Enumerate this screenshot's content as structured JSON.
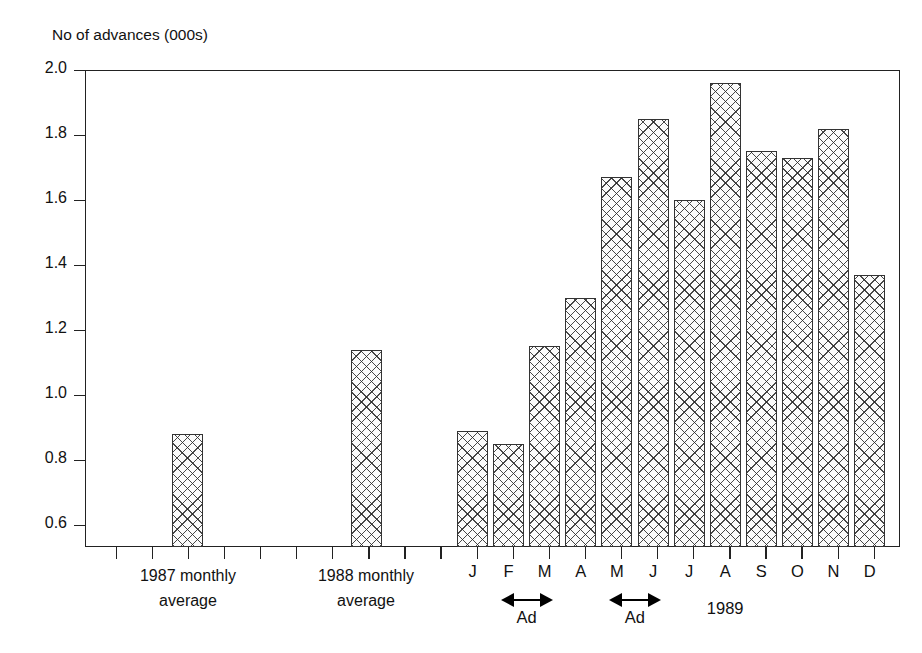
{
  "page": {
    "top_fragment": "",
    "background": "#ffffff"
  },
  "chart_data": {
    "type": "bar",
    "title": "",
    "xlabel": "",
    "ylabel": "No of advances (000s)",
    "ylim": [
      0.5,
      2.0
    ],
    "yticks": [
      2.0,
      1.8,
      1.6,
      1.4,
      1.2,
      1.0,
      0.8,
      0.6
    ],
    "ytick_labels": [
      "2.0",
      "1.8",
      "1.6",
      "1.4",
      "1.2",
      "1.0",
      "0.8",
      "0.6"
    ],
    "grid": false,
    "legend": null,
    "bar_style": {
      "fill": "cross-hatch",
      "edge_color": "#333333",
      "face_color": "#fbfbfb"
    },
    "groups": [
      {
        "name": "1987",
        "label_lines": [
          "1987 monthly",
          "average"
        ],
        "categories": [
          "1987 monthly average"
        ],
        "values": [
          0.88
        ]
      },
      {
        "name": "1988",
        "label_lines": [
          "1988 monthly",
          "average"
        ],
        "categories": [
          "1988 monthly average"
        ],
        "values": [
          1.14
        ]
      },
      {
        "name": "1989",
        "label_lines": [
          "1989"
        ],
        "categories": [
          "J",
          "F",
          "M",
          "A",
          "M",
          "J",
          "J",
          "A",
          "S",
          "O",
          "N",
          "D"
        ],
        "values": [
          0.89,
          0.85,
          1.15,
          1.3,
          1.67,
          1.85,
          1.6,
          1.96,
          1.75,
          1.73,
          1.82,
          1.37
        ]
      }
    ],
    "categories": [
      "1987 monthly average",
      "1988 monthly average",
      "J",
      "F",
      "M",
      "A",
      "M",
      "J",
      "J",
      "A",
      "S",
      "O",
      "N",
      "D"
    ],
    "values": [
      0.88,
      1.14,
      0.89,
      0.85,
      1.15,
      1.3,
      1.67,
      1.85,
      1.6,
      1.96,
      1.75,
      1.73,
      1.82,
      1.37
    ],
    "annotations": [
      {
        "label": "Ad",
        "marker": "double-arrow",
        "spans": [
          "F",
          "M"
        ]
      },
      {
        "label": "Ad",
        "marker": "double-arrow",
        "spans": [
          "M",
          "J"
        ]
      },
      {
        "label": "1989",
        "marker": "text",
        "spans": [
          "J",
          "A"
        ]
      }
    ]
  }
}
